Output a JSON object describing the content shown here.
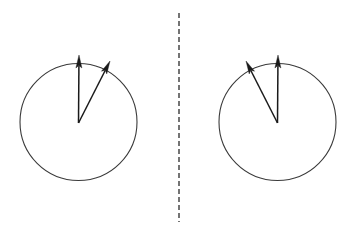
{
  "figure": {
    "type": "vector-diagram",
    "title": "",
    "background_color": "#ffffff",
    "width": 358,
    "height": 232,
    "stroke_color": "#3a3a3a",
    "arrow_color": "#1a1a1a",
    "divider": {
      "name": "mirror-axis",
      "orientation": "vertical",
      "style": "dashed",
      "x": 179,
      "y_start": 13,
      "y_end": 222,
      "dash_length": 5,
      "gap_length": 3,
      "stroke_width": 1.4,
      "color": "#3a3a3a"
    },
    "panels": [
      {
        "id": "left-panel",
        "label": "",
        "circle": {
          "cx": 78.5,
          "cy": 122,
          "r": 58.5,
          "stroke_width": 1.1,
          "color": "#3a3a3a",
          "fill": "none"
        },
        "vectors": [
          {
            "id": "left-vector-vertical",
            "label": "",
            "origin_x": 78.5,
            "origin_y": 123,
            "tip_x": 79,
            "tip_y": 55,
            "angle_deg": 90,
            "length": 68,
            "head_width": 6,
            "head_length": 13,
            "stroke_width": 1.5
          },
          {
            "id": "left-vector-slanted",
            "label": "",
            "origin_x": 78.5,
            "origin_y": 123,
            "tip_x": 110,
            "tip_y": 61,
            "angle_deg": 63,
            "length": 69.5,
            "head_width": 6,
            "head_length": 13,
            "stroke_width": 1.5
          }
        ]
      },
      {
        "id": "right-panel",
        "label": "",
        "circle": {
          "cx": 277.5,
          "cy": 122,
          "r": 58.5,
          "stroke_width": 1.1,
          "color": "#3a3a3a",
          "fill": "none"
        },
        "vectors": [
          {
            "id": "right-vector-vertical",
            "label": "",
            "origin_x": 277.5,
            "origin_y": 123,
            "tip_x": 278,
            "tip_y": 55,
            "angle_deg": 90,
            "length": 68,
            "head_width": 6,
            "head_length": 13,
            "stroke_width": 1.5
          },
          {
            "id": "right-vector-slanted",
            "label": "",
            "origin_x": 277.5,
            "origin_y": 123,
            "tip_x": 246,
            "tip_y": 61,
            "angle_deg": 117,
            "length": 69.5,
            "head_width": 6,
            "head_length": 13,
            "stroke_width": 1.5
          }
        ]
      }
    ]
  }
}
